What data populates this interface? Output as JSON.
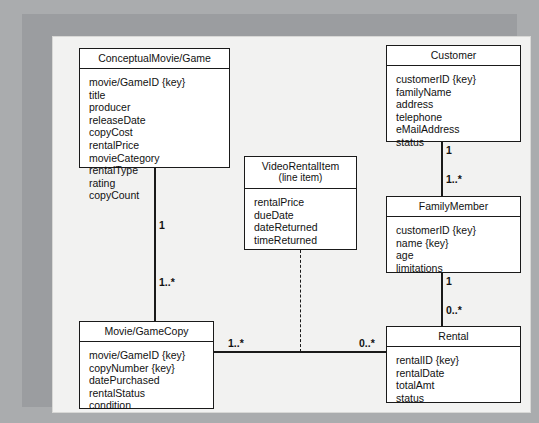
{
  "diagram": {
    "classes": [
      {
        "id": "conceptual-movie-game",
        "name": "ConceptualMovie/Game",
        "stereotype": "",
        "attributes": [
          "movie/GameID {key}",
          "title",
          "producer",
          "releaseDate",
          "copyCost",
          "rentalPrice",
          "movieCategory",
          "rentalType",
          "rating",
          "copyCount"
        ]
      },
      {
        "id": "customer",
        "name": "Customer",
        "stereotype": "",
        "attributes": [
          "customerID {key}",
          "familyName",
          "address",
          "telephone",
          "eMailAddress",
          "status"
        ]
      },
      {
        "id": "video-rental-item",
        "name": "VideoRentalItem",
        "stereotype": "(line item)",
        "attributes": [
          "rentalPrice",
          "dueDate",
          "dateReturned",
          "timeReturned"
        ]
      },
      {
        "id": "family-member",
        "name": "FamilyMember",
        "stereotype": "",
        "attributes": [
          "customerID {key}",
          "name {key}",
          "age",
          "limitations"
        ]
      },
      {
        "id": "movie-game-copy",
        "name": "Movie/GameCopy",
        "stereotype": "",
        "attributes": [
          "movie/GameID {key}",
          "copyNumber {key}",
          "datePurchased",
          "rentalStatus",
          "condition"
        ]
      },
      {
        "id": "rental",
        "name": "Rental",
        "stereotype": "",
        "attributes": [
          "rentalID {key}",
          "rentalDate",
          "totalAmt",
          "status"
        ]
      }
    ],
    "multiplicities": {
      "conceptual_to_copy_top": "1",
      "conceptual_to_copy_bottom": "1..*",
      "customer_to_family_top": "1",
      "customer_to_family_bottom": "1..*",
      "family_to_rental_top": "1",
      "family_to_rental_bottom": "0..*",
      "copy_to_rental_left": "1..*",
      "copy_to_rental_right": "0..*"
    },
    "colors": {
      "background": "#aaacae",
      "frame": "#9b9da0",
      "canvas": "#f2f2f1",
      "box_fill": "#ffffff",
      "line": "#1a1a1a"
    }
  }
}
